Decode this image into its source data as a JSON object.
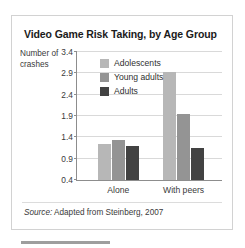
{
  "figure": {
    "title": "Video Game Risk Taking, by Age Group",
    "y_axis_title_line1": "Number of",
    "y_axis_title_line2": "crashes",
    "source_prefix": "Source:",
    "source_text": "Adapted from Steinberg, 2007"
  },
  "colors": {
    "adolescents": "#b7b7b7",
    "young_adults": "#949494",
    "adults": "#424242",
    "gridline": "#d9d9d9",
    "axis": "#8d8d8d",
    "frame_border": "#d2d2d2",
    "footer_bar": "#9e9e9e"
  },
  "chart_data": {
    "type": "bar",
    "title": "Video Game Risk Taking, by Age Group",
    "xlabel": "",
    "ylabel": "Number of crashes",
    "categories": [
      "Alone",
      "With peers"
    ],
    "series": [
      {
        "name": "Adolescents",
        "values": [
          1.25,
          2.92
        ]
      },
      {
        "name": "Young adults",
        "values": [
          1.33,
          1.95
        ]
      },
      {
        "name": "Adults",
        "values": [
          1.2,
          1.15
        ]
      }
    ],
    "ylim": [
      0.4,
      3.4
    ],
    "yticks": [
      "0.4",
      "0.9",
      "1.4",
      "1.9",
      "2.4",
      "2.9",
      "3.4"
    ],
    "ytick_values": [
      0.4,
      0.9,
      1.4,
      1.9,
      2.4,
      2.9,
      3.4
    ],
    "grid": true,
    "legend_position": "inside-top-left"
  }
}
